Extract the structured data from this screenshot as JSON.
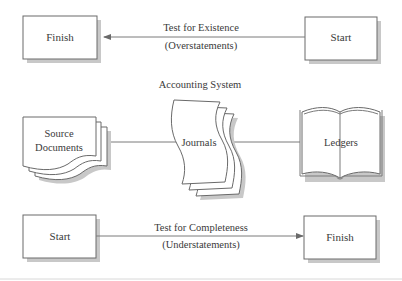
{
  "diagram": {
    "top_flow": {
      "left_box": {
        "label": "Finish"
      },
      "right_box": {
        "label": "Start"
      },
      "arrow": {
        "direction": "right-to-left",
        "label_line1": "Test for Existence",
        "label_line2": "(Overstatements)"
      }
    },
    "system": {
      "title": "Accounting System",
      "source_documents": {
        "label_line1": "Source",
        "label_line2": "Documents"
      },
      "journals": {
        "label": "Journals"
      },
      "ledgers": {
        "label": "Ledgers"
      }
    },
    "bottom_flow": {
      "left_box": {
        "label": "Start"
      },
      "right_box": {
        "label": "Finish"
      },
      "arrow": {
        "direction": "left-to-right",
        "label_line1": "Test for Completeness",
        "label_line2": "(Understatements)"
      }
    },
    "colors": {
      "stroke": "#6a6a6a",
      "shadow": "#c8c8c8",
      "text": "#3a3a3a",
      "background": "#ffffff"
    }
  }
}
